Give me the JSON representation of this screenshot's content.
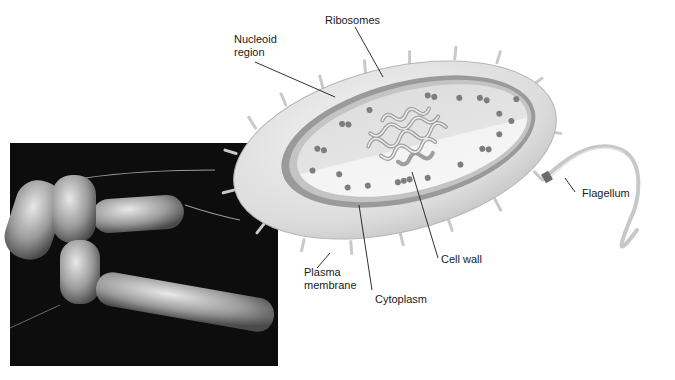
{
  "figure": {
    "photo": {
      "subject": "scanning electron micrograph of rod-shaped bacteria with flagella",
      "background_color": "#0d0d0d"
    },
    "colors": {
      "cell_wall": "#d9d9d9",
      "membrane": "#8c8c8c",
      "cytoplasm": "#e6e6e6",
      "cytoplasm_light": "#f2f2f2",
      "ribosome": "#7a7a7a",
      "nucleoid": "#bdbdbd",
      "flagellum": "#c8c8c8",
      "leader_line": "#1a1a1a"
    },
    "labels": {
      "ribosomes": "Ribosomes",
      "nucleoid": "Nucleoid\nregion",
      "flagellum": "Flagellum",
      "plasma_membrane": "Plasma\nmembrane",
      "cytoplasm": "Cytoplasm",
      "cell_wall": "Cell wall"
    }
  }
}
